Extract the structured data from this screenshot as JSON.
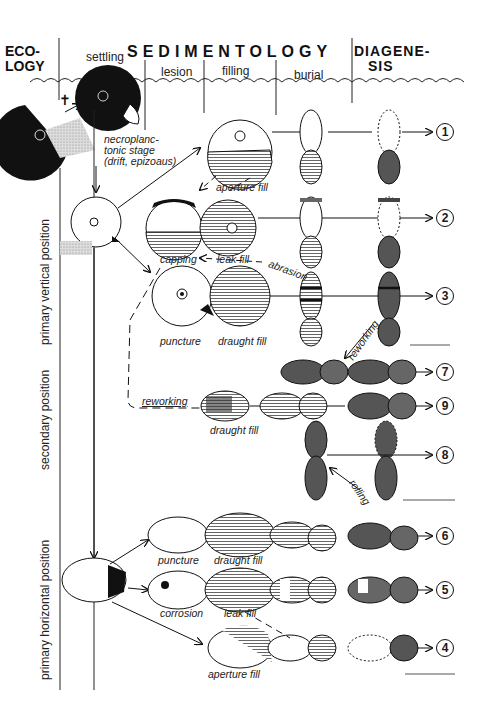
{
  "header": {
    "ecology": [
      "ECO-",
      "LOGY"
    ],
    "sedimentology": "SEDIMENTOLOGY",
    "diagenesis": [
      "DIAGENE-",
      "SIS"
    ],
    "columns": [
      "settling",
      "lesion",
      "filling",
      "burial"
    ]
  },
  "side_labels": {
    "primary_vertical": "primary vertical position",
    "secondary": "secondary position",
    "primary_horizontal": "primary horizontal position"
  },
  "stage_labels": {
    "necroplanktonic": [
      "necroplanc-",
      "tonic stage",
      "(drift, epizoaus)"
    ],
    "aperture_fill_1": "aperture fill",
    "capping": "capping",
    "leak_fill_2": "leak fill",
    "abrasion": "abrasion",
    "puncture_3": "puncture",
    "draught_fill_3": "draught fill",
    "reworking_top": "reworking",
    "reworking_left": "reworking",
    "draught_fill_9": "draught fill",
    "rolling": "rolling",
    "puncture_6": "puncture",
    "draught_fill_6": "draught fill",
    "corrosion": "corrosion",
    "leak_fill_5": "leak fill",
    "aperture_fill_4": "aperture fill"
  },
  "outcomes": [
    "1",
    "2",
    "3",
    "7",
    "9",
    "8",
    "6",
    "5",
    "4"
  ],
  "colors": {
    "ink": "#111111",
    "dark_fill": "#4a4a4a",
    "hatch": "#777777",
    "paper": "#ffffff"
  }
}
